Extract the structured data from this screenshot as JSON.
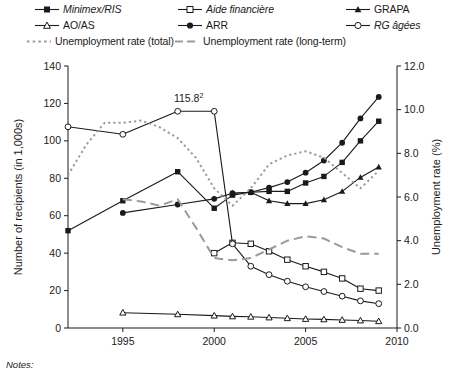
{
  "chart_data": {
    "type": "line",
    "title": "",
    "xlabel": "",
    "ylabel": "Number of recipients (in 1,000s)",
    "ylabel_right": "Unemployment rate (%)",
    "xlim": [
      1992,
      2010
    ],
    "ylim": [
      0,
      140
    ],
    "ylim_right": [
      0.0,
      12.0
    ],
    "xticks": [
      1995,
      2000,
      2005,
      2010
    ],
    "yticks": [
      0,
      20,
      40,
      60,
      80,
      100,
      120,
      140
    ],
    "yticks_right": [
      "0.0",
      "2.0",
      "4.0",
      "6.0",
      "8.0",
      "10.0",
      "12.0"
    ],
    "grid": false,
    "legend_position": "top",
    "annotations": [
      {
        "text": "115.8",
        "superscript": "2",
        "x": 1998.6,
        "y": 120.5
      }
    ],
    "series": [
      {
        "name": "Minimex/RIS",
        "marker": "filled-square",
        "line": "solid",
        "axis": "left",
        "x": [
          1992,
          1995,
          1998,
          2000,
          2001,
          2002,
          2003,
          2004,
          2005,
          2006,
          2007,
          2008,
          2009
        ],
        "values": [
          52.0,
          68.0,
          83.5,
          64.0,
          71.0,
          72.5,
          73.0,
          73.0,
          77.5,
          81.0,
          88.5,
          100.0,
          110.5
        ]
      },
      {
        "name": "Aide financière",
        "marker": "open-square",
        "line": "solid",
        "axis": "left",
        "x": [
          2000,
          2001,
          2002,
          2003,
          2004,
          2005,
          2006,
          2007,
          2008,
          2009
        ],
        "values": [
          40.0,
          45.5,
          45.0,
          41.0,
          36.5,
          33.0,
          30.0,
          26.5,
          21.0,
          20.0
        ]
      },
      {
        "name": "GRAPA",
        "marker": "filled-triangle",
        "line": "solid",
        "axis": "left",
        "x": [
          2001,
          2002,
          2003,
          2004,
          2005,
          2006,
          2007,
          2008,
          2009
        ],
        "values": [
          72.0,
          72.5,
          68.0,
          66.5,
          66.5,
          68.5,
          73.0,
          80.5,
          86.0
        ]
      },
      {
        "name": "AO/AS",
        "marker": "open-triangle",
        "line": "solid",
        "axis": "left",
        "x": [
          1995,
          1998,
          2000,
          2001,
          2002,
          2003,
          2004,
          2005,
          2006,
          2007,
          2008,
          2009
        ],
        "values": [
          8.2,
          7.3,
          6.6,
          6.2,
          6.0,
          5.6,
          5.2,
          4.8,
          4.6,
          4.3,
          4.0,
          3.6
        ]
      },
      {
        "name": "ARR",
        "marker": "filled-circle",
        "line": "solid",
        "axis": "left",
        "x": [
          1995,
          1998,
          2000,
          2001,
          2002,
          2003,
          2004,
          2005,
          2006,
          2007,
          2008,
          2009
        ],
        "values": [
          61.5,
          66.0,
          69.0,
          72.0,
          72.5,
          75.0,
          78.0,
          83.0,
          89.5,
          99.0,
          112.0,
          123.5
        ]
      },
      {
        "name": "RG âgées",
        "marker": "open-circle",
        "line": "solid",
        "axis": "left",
        "x": [
          1992,
          1995,
          1998,
          2000,
          2001,
          2002,
          2003,
          2004,
          2005,
          2006,
          2007,
          2008,
          2009
        ],
        "values": [
          107.5,
          103.5,
          115.8,
          115.8,
          45.0,
          33.0,
          28.5,
          25.0,
          22.0,
          19.5,
          17.0,
          14.5,
          13.0
        ]
      },
      {
        "name": "Unemployment rate (total)",
        "marker": "none",
        "line": "dotted",
        "axis": "right",
        "x": [
          1992,
          1993,
          1994,
          1995,
          1996,
          1997,
          1998,
          1999,
          2000,
          2001,
          2002,
          2003,
          2004,
          2005,
          2006,
          2007,
          2008,
          2009
        ],
        "values": [
          7.0,
          8.4,
          9.4,
          9.4,
          9.5,
          9.2,
          8.7,
          7.8,
          6.4,
          5.6,
          6.4,
          7.5,
          7.9,
          8.1,
          7.8,
          7.1,
          6.4,
          7.2
        ]
      },
      {
        "name": "Unemployment rate (long-term)",
        "marker": "none",
        "line": "dashed",
        "axis": "right",
        "x": [
          1995,
          1996,
          1997,
          1998,
          1999,
          2000,
          2001,
          2002,
          2003,
          2004,
          2005,
          2006,
          2007,
          2008,
          2009
        ],
        "values": [
          5.9,
          5.8,
          5.6,
          5.9,
          4.6,
          3.2,
          3.1,
          3.2,
          3.6,
          4.0,
          4.2,
          4.1,
          3.7,
          3.4,
          3.4
        ]
      }
    ]
  },
  "legend": {
    "items": [
      {
        "label": "Minimex/RIS",
        "italic": true,
        "symbol": "line-filled-square"
      },
      {
        "label": "Aide financière",
        "italic": true,
        "symbol": "line-open-square"
      },
      {
        "label": "GRAPA",
        "italic": false,
        "symbol": "line-filled-triangle"
      },
      {
        "label": "AO/AS",
        "italic": false,
        "symbol": "line-open-triangle"
      },
      {
        "label": "ARR",
        "italic": false,
        "symbol": "line-filled-circle"
      },
      {
        "label": "RG âgées",
        "italic": true,
        "symbol": "line-open-circle"
      },
      {
        "label": "Unemployment rate (total)",
        "italic": false,
        "symbol": "dotted-line"
      },
      {
        "label": "Unemployment rate (long-term)",
        "italic": false,
        "symbol": "dashed-line"
      }
    ]
  },
  "axes": {
    "left_title": "Number of recipients (in 1,000s)",
    "right_title": "Unemployment rate (%)",
    "y_left_ticks": [
      "140",
      "120",
      "100",
      "80",
      "60",
      "40",
      "20",
      "0"
    ],
    "y_right_ticks": [
      "12.0",
      "10.0",
      "8.0",
      "6.0",
      "4.0",
      "2.0",
      "0.0"
    ],
    "x_ticks": [
      "1995",
      "2000",
      "2005",
      "2010"
    ]
  },
  "annotation": {
    "value": "115.8",
    "footnote": "2"
  },
  "footer": {
    "notes_label": "Notes:"
  },
  "colors": {
    "ink": "#1a1a1a",
    "gray": "#9a9a9a",
    "background": "#ffffff"
  }
}
